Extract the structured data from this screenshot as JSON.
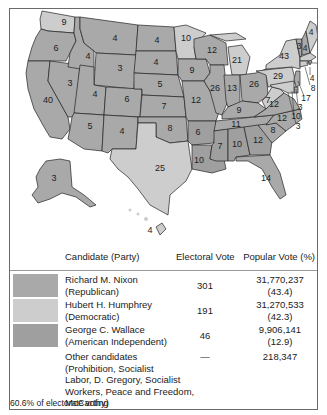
{
  "legend_colors": {
    "republican": "#a9a9a9",
    "democratic": "#cdcdcd",
    "american_independent": "#9f9f9f"
  },
  "map": {
    "states": [
      {
        "abbr": "WA",
        "ev": "9",
        "party": "democratic"
      },
      {
        "abbr": "OR",
        "ev": "6",
        "party": "republican"
      },
      {
        "abbr": "CA",
        "ev": "40",
        "party": "republican"
      },
      {
        "abbr": "NV",
        "ev": "3",
        "party": "republican"
      },
      {
        "abbr": "ID",
        "ev": "4",
        "party": "republican"
      },
      {
        "abbr": "MT",
        "ev": "4",
        "party": "republican"
      },
      {
        "abbr": "WY",
        "ev": "3",
        "party": "republican"
      },
      {
        "abbr": "UT",
        "ev": "4",
        "party": "republican"
      },
      {
        "abbr": "AZ",
        "ev": "5",
        "party": "republican"
      },
      {
        "abbr": "CO",
        "ev": "6",
        "party": "republican"
      },
      {
        "abbr": "NM",
        "ev": "4",
        "party": "republican"
      },
      {
        "abbr": "ND",
        "ev": "4",
        "party": "republican"
      },
      {
        "abbr": "SD",
        "ev": "4",
        "party": "republican"
      },
      {
        "abbr": "NE",
        "ev": "5",
        "party": "republican"
      },
      {
        "abbr": "KS",
        "ev": "7",
        "party": "republican"
      },
      {
        "abbr": "OK",
        "ev": "8",
        "party": "republican"
      },
      {
        "abbr": "TX",
        "ev": "25",
        "party": "democratic"
      },
      {
        "abbr": "MN",
        "ev": "10",
        "party": "democratic"
      },
      {
        "abbr": "IA",
        "ev": "9",
        "party": "republican"
      },
      {
        "abbr": "MO",
        "ev": "12",
        "party": "republican"
      },
      {
        "abbr": "AR",
        "ev": "6",
        "party": "american_independent"
      },
      {
        "abbr": "LA",
        "ev": "10",
        "party": "american_independent"
      },
      {
        "abbr": "WI",
        "ev": "12",
        "party": "republican"
      },
      {
        "abbr": "IL",
        "ev": "26",
        "party": "republican"
      },
      {
        "abbr": "MI",
        "ev": "21",
        "party": "democratic"
      },
      {
        "abbr": "IN",
        "ev": "13",
        "party": "republican"
      },
      {
        "abbr": "OH",
        "ev": "26",
        "party": "republican"
      },
      {
        "abbr": "KY",
        "ev": "9",
        "party": "republican"
      },
      {
        "abbr": "TN",
        "ev": "11",
        "party": "republican"
      },
      {
        "abbr": "MS",
        "ev": "7",
        "party": "american_independent"
      },
      {
        "abbr": "AL",
        "ev": "10",
        "party": "american_independent"
      },
      {
        "abbr": "GA",
        "ev": "12",
        "party": "american_independent"
      },
      {
        "abbr": "FL",
        "ev": "14",
        "party": "republican"
      },
      {
        "abbr": "SC",
        "ev": "8",
        "party": "republican"
      },
      {
        "abbr": "NC",
        "ev": "12",
        "party": "republican"
      },
      {
        "abbr": "VA",
        "ev": "12",
        "party": "republican"
      },
      {
        "abbr": "WV",
        "ev": "7",
        "party": "democratic"
      },
      {
        "abbr": "PA",
        "ev": "29",
        "party": "democratic"
      },
      {
        "abbr": "NY",
        "ev": "43",
        "party": "democratic"
      },
      {
        "abbr": "VT",
        "ev": "3",
        "party": "republican"
      },
      {
        "abbr": "NH",
        "ev": "4",
        "party": "republican"
      },
      {
        "abbr": "ME",
        "ev": "4",
        "party": "democratic"
      },
      {
        "abbr": "MA",
        "ev": "14",
        "party": "democratic"
      },
      {
        "abbr": "RI",
        "ev": "4",
        "party": "democratic"
      },
      {
        "abbr": "CT",
        "ev": "8",
        "party": "democratic"
      },
      {
        "abbr": "NJ",
        "ev": "17",
        "party": "republican"
      },
      {
        "abbr": "DE",
        "ev": "3",
        "party": "republican"
      },
      {
        "abbr": "MD",
        "ev": "10",
        "party": "democratic"
      },
      {
        "abbr": "DC",
        "ev": "3",
        "party": "democratic"
      },
      {
        "abbr": "AK",
        "ev": "3",
        "party": "republican"
      },
      {
        "abbr": "HI",
        "ev": "4",
        "party": "democratic"
      }
    ]
  },
  "table": {
    "headers": {
      "candidate": "Candidate (Party)",
      "electoral": "Electoral Vote",
      "popular": "Popular Vote (%)"
    },
    "rows": [
      {
        "name": "Richard M. Nixon",
        "party": "(Republican)",
        "electoral": "301",
        "popular": "31,770,237",
        "percent": "(43.4)"
      },
      {
        "name": "Hubert H. Humphrey",
        "party": "(Democratic)",
        "electoral": "191",
        "popular": "31,270,533",
        "percent": "(42.3)"
      },
      {
        "name": "George C. Wallace",
        "party": "(American Independent)",
        "electoral": "46",
        "popular": "9,906,141",
        "percent": "(12.9)"
      }
    ],
    "other": {
      "line1": "Other candidates",
      "line2": "(Prohibition, Socialist",
      "line3": "Labor, D. Gregory, Socialist",
      "line4": "Workers, Peace and Freedom,",
      "line5": "McCarthy)",
      "electoral": "—",
      "popular": "218,347"
    }
  },
  "footer": "60.6% of electorate voting"
}
